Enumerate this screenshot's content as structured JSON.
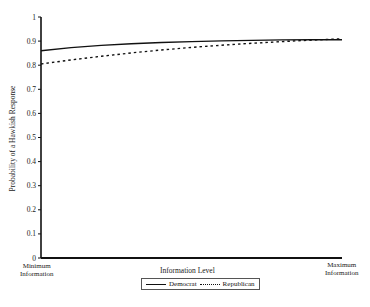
{
  "chart_data": {
    "type": "line",
    "title": "",
    "xlabel": "Information Level",
    "ylabel": "Probability of a Hawkish Response",
    "x_tick_labels": [
      "Minimum Information",
      "Maximum Information"
    ],
    "y_ticks": [
      0,
      0.1,
      0.2,
      0.3,
      0.4,
      0.5,
      0.6,
      0.7,
      0.8,
      0.9,
      1
    ],
    "ylim": [
      0,
      1
    ],
    "x": [
      0,
      0.1,
      0.2,
      0.3,
      0.4,
      0.5,
      0.6,
      0.7,
      0.8,
      0.9,
      1.0
    ],
    "series": [
      {
        "name": "Democrat",
        "style": "solid",
        "values": [
          0.86,
          0.873,
          0.882,
          0.889,
          0.894,
          0.898,
          0.901,
          0.903,
          0.905,
          0.906,
          0.906
        ]
      },
      {
        "name": "Republican",
        "style": "dashed",
        "values": [
          0.805,
          0.822,
          0.837,
          0.851,
          0.863,
          0.874,
          0.883,
          0.891,
          0.898,
          0.904,
          0.91
        ]
      }
    ],
    "grid": false,
    "legend_position": "bottom-center"
  },
  "labels": {
    "xlabel": "Information Level",
    "ylabel": "Probability of a Hawkish Response",
    "x_min": "Minimum\nInformation",
    "x_min_1": "Minimum",
    "x_min_2": "Information",
    "x_max_1": "Maximum",
    "x_max_2": "Information",
    "legend_democrat": "Democrat",
    "legend_republican": "Republican"
  }
}
